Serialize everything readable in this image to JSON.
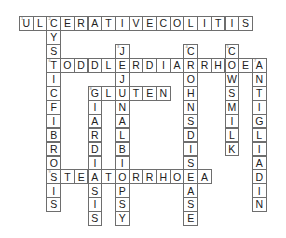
{
  "puzzle": {
    "grid": {
      "origin_x": 19,
      "origin_y": 16,
      "cell_w": 13.7,
      "cell_h": 13.95
    },
    "words": [
      {
        "id": "ulcerative-colitis",
        "answer": "ULCERATIVECOLITIS",
        "dir": "across",
        "row": 0,
        "col": 0,
        "number": "1"
      },
      {
        "id": "cystic-fibrosis",
        "answer": "CYSTICFIBROSIS",
        "dir": "down",
        "row": 0,
        "col": 2,
        "number": "2"
      },
      {
        "id": "jejunal-biopsy",
        "answer": "JEJUNALBIOPSY",
        "dir": "down",
        "row": 2,
        "col": 7,
        "number": "3"
      },
      {
        "id": "crohns-disease",
        "answer": "CROHNSDISEASE",
        "dir": "down",
        "row": 2,
        "col": 12,
        "number": "4"
      },
      {
        "id": "cows-milk",
        "answer": "COWSMILK",
        "dir": "down",
        "row": 2,
        "col": 15,
        "number": "5"
      },
      {
        "id": "toddler-diarrhoea",
        "answer": "TODDLERDIARRHOEA",
        "dir": "across",
        "row": 3,
        "col": 2,
        "number": "6"
      },
      {
        "id": "antigliadin",
        "answer": "ANTIGLIADIN",
        "dir": "down",
        "row": 3,
        "col": 17,
        "number": "7"
      },
      {
        "id": "gluten",
        "answer": "GLUTEN",
        "dir": "across",
        "row": 5,
        "col": 5,
        "number": "8"
      },
      {
        "id": "giardiasis",
        "answer": "GIARDIASIS",
        "dir": "down",
        "row": 5,
        "col": 5,
        "number": ""
      },
      {
        "id": "steatorrhoea",
        "answer": "STEATORRHOEA",
        "dir": "across",
        "row": 11,
        "col": 2,
        "number": "9"
      }
    ]
  }
}
